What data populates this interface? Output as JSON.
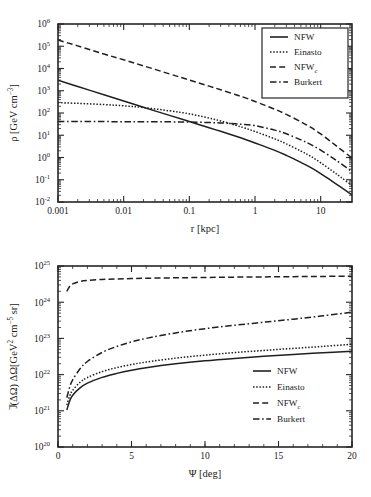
{
  "figure": {
    "name": "dark-matter-density-and-j-factor-figure",
    "background": "#ffffff",
    "line_color": "#1f1f1f",
    "axis_color": "#262626"
  },
  "chart_data": [
    {
      "id": "density-profile",
      "type": "line",
      "title": "",
      "xlabel": "r [kpc]",
      "ylabel": "ρ [GeV cm−3]",
      "ylabel_parts": {
        "symbol": "ρ",
        "unit_open": " [GeV cm",
        "unit_exp": "−3",
        "unit_close": "]"
      },
      "xscale": "log",
      "yscale": "log",
      "xlim": [
        0.001,
        30
      ],
      "ylim": [
        0.01,
        1000000
      ],
      "grid": false,
      "xticks": [
        0.001,
        0.01,
        0.1,
        1,
        10
      ],
      "xticklabels": [
        "0.001",
        "0.01",
        "0.1",
        "1",
        "10"
      ],
      "yticks": [
        0.01,
        0.1,
        1,
        10,
        100,
        1000,
        10000,
        100000,
        1000000
      ],
      "yticklabels": [
        "10−2",
        "10−1",
        "10⁰",
        "10¹",
        "10²",
        "10³",
        "10⁴",
        "10⁵",
        "10⁶"
      ],
      "ytick_exponents": [
        "-2",
        "-1",
        "0",
        "1",
        "2",
        "3",
        "4",
        "5",
        "6"
      ],
      "legend_position": "upper right",
      "legend_boxed": true,
      "series": [
        {
          "name": "NFW",
          "label": "NFW",
          "style": "solid",
          "x": [
            0.001,
            0.002,
            0.005,
            0.01,
            0.02,
            0.05,
            0.1,
            0.2,
            0.3,
            0.5,
            0.7,
            1,
            2,
            3,
            5,
            7,
            10,
            15,
            20,
            30
          ],
          "y": [
            3000,
            1550,
            660,
            345,
            180,
            78.0,
            41.5,
            21.8,
            15.0,
            9.2,
            6.6,
            4.5,
            2.1,
            1.25,
            0.6,
            0.36,
            0.19,
            0.085,
            0.048,
            0.021
          ]
        },
        {
          "name": "Einasto",
          "label": "Einasto",
          "style": "dotted",
          "x": [
            0.001,
            0.002,
            0.005,
            0.01,
            0.02,
            0.05,
            0.1,
            0.2,
            0.3,
            0.5,
            0.7,
            1,
            2,
            3,
            5,
            7,
            10,
            15,
            20,
            30
          ],
          "y": [
            290,
            272,
            240,
            210,
            176,
            125,
            92.0,
            59.0,
            44.0,
            28.5,
            21.0,
            14.8,
            6.9,
            4.1,
            1.95,
            1.15,
            0.58,
            0.25,
            0.135,
            0.055
          ]
        },
        {
          "name": "NFW_c",
          "label": "NFW",
          "label_sub": "c",
          "style": "dashed",
          "x": [
            0.001,
            0.002,
            0.005,
            0.01,
            0.02,
            0.05,
            0.1,
            0.2,
            0.3,
            0.5,
            0.7,
            1,
            2,
            3,
            5,
            7,
            10,
            15,
            20,
            30
          ],
          "y": [
            190000,
            104000,
            45000,
            24500,
            13200,
            5700,
            3050,
            1610,
            1110,
            680,
            490,
            330,
            148,
            87.0,
            40.0,
            23.0,
            11.5,
            4.6,
            2.4,
            0.95
          ]
        },
        {
          "name": "Burkert",
          "label": "Burkert",
          "style": "dashdot",
          "x": [
            0.001,
            0.002,
            0.005,
            0.01,
            0.02,
            0.05,
            0.1,
            0.2,
            0.3,
            0.5,
            0.7,
            1,
            2,
            3,
            5,
            7,
            10,
            15,
            20,
            30
          ],
          "y": [
            41.0,
            41.0,
            41.0,
            40.8,
            40.6,
            40.0,
            39.2,
            37.4,
            35.8,
            32.8,
            30.2,
            27.0,
            17.0,
            11.6,
            6.2,
            3.9,
            2.15,
            0.98,
            0.55,
            0.23
          ]
        }
      ]
    },
    {
      "id": "j-factor",
      "type": "line",
      "title": "",
      "xlabel": "Ψ [deg]",
      "ylabel": "J̄(ΔΩ) ΔΩ [GeV² cm−5 sr]",
      "ylabel_parts": {
        "jbar": "J",
        "arg": "(ΔΩ) ΔΩ[GeV",
        "sup1": "2",
        "mid": " cm",
        "sup2": "−5",
        "close": " sr]"
      },
      "xscale": "linear",
      "yscale": "log",
      "xlim": [
        0,
        20
      ],
      "ylim": [
        1e+20,
        1e+25
      ],
      "grid": false,
      "xticks": [
        0,
        5,
        10,
        15,
        20
      ],
      "xticklabels": [
        "0",
        "5",
        "10",
        "15",
        "20"
      ],
      "yticks": [
        1e+20,
        1e+21,
        1e+22,
        1e+23,
        1e+24,
        1e+25
      ],
      "yticklabels": [
        "10²⁰",
        "10²¹",
        "10²²",
        "10²³",
        "10²⁴",
        "10²⁵"
      ],
      "ytick_exponents": [
        "20",
        "21",
        "22",
        "23",
        "24",
        "25"
      ],
      "legend_position": "lower right",
      "legend_boxed": false,
      "series": [
        {
          "name": "NFW",
          "label": "NFW",
          "style": "solid",
          "x": [
            0.6,
            0.8,
            1.0,
            1.5,
            2,
            3,
            4,
            5,
            6,
            8,
            10,
            12,
            14,
            16,
            18,
            20
          ],
          "y": [
            1.05e+21,
            1.9e+21,
            2.7e+21,
            4.3e+21,
            5.8e+21,
            8.4e+21,
            1.08e+22,
            1.32e+22,
            1.55e+22,
            1.98e+22,
            2.4e+22,
            2.8e+22,
            3.2e+22,
            3.6e+22,
            4e+22,
            4.45e+22
          ]
        },
        {
          "name": "Einasto",
          "label": "Einasto",
          "style": "dotted",
          "x": [
            0.6,
            0.8,
            1.0,
            1.5,
            2,
            3,
            4,
            5,
            6,
            8,
            10,
            12,
            14,
            16,
            18,
            20
          ],
          "y": [
            1.45e+21,
            2.6e+21,
            3.7e+21,
            6.1e+21,
            8.3e+21,
            1.21e+22,
            1.56e+22,
            1.9e+22,
            2.22e+22,
            2.85e+22,
            3.45e+22,
            4.05e+22,
            4.65e+22,
            5.3e+22,
            6e+22,
            6.9e+22
          ]
        },
        {
          "name": "NFW_c",
          "label": "NFW",
          "label_sub": "c",
          "style": "dashed",
          "x": [
            0.6,
            0.8,
            1.0,
            1.5,
            2,
            3,
            4,
            5,
            6,
            8,
            10,
            12,
            14,
            16,
            18,
            20
          ],
          "y": [
            2e+24,
            2.75e+24,
            3.2e+24,
            3.75e+24,
            4e+24,
            4.25e+24,
            4.4e+24,
            4.5e+24,
            4.6e+24,
            4.72e+24,
            4.82e+24,
            4.92e+24,
            5e+24,
            5.08e+24,
            5.15e+24,
            5.25e+24
          ]
        },
        {
          "name": "Burkert",
          "label": "Burkert",
          "style": "dashdot",
          "x": [
            0.6,
            0.8,
            1.0,
            1.5,
            2,
            3,
            4,
            5,
            6,
            8,
            10,
            12,
            14,
            16,
            18,
            20
          ],
          "y": [
            2.3e+21,
            4.6e+21,
            7.2e+21,
            1.45e+22,
            2.3e+22,
            4.1e+22,
            6e+22,
            8e+22,
            1e+23,
            1.42e+23,
            1.85e+23,
            2.3e+23,
            2.8e+23,
            3.4e+23,
            4.2e+23,
            5.3e+23
          ]
        }
      ]
    }
  ]
}
